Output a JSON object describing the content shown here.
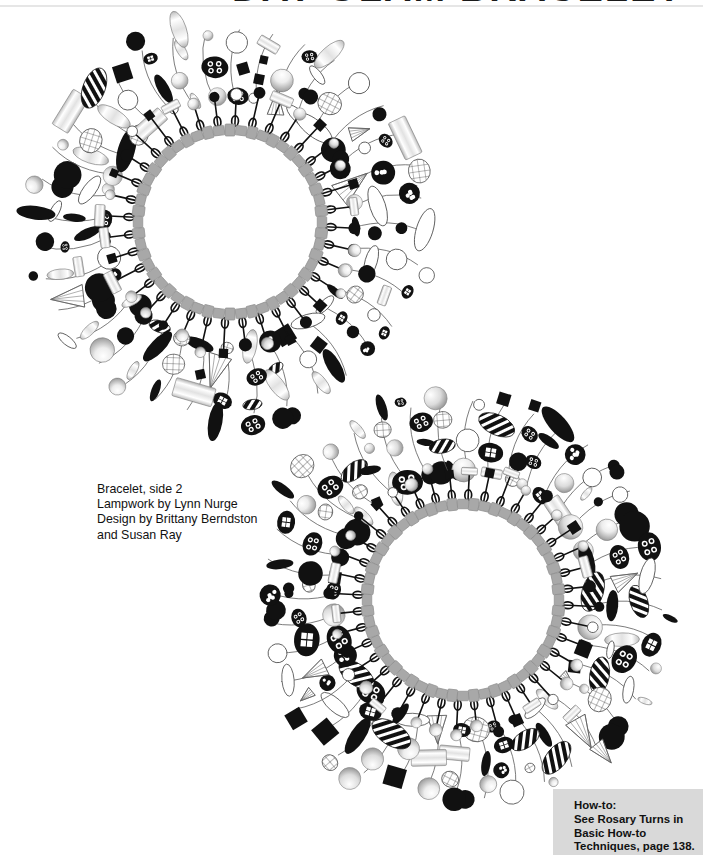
{
  "page": {
    "background_color": "#ffffff",
    "title_partial": "DAY-GLAM BRACELET",
    "rule_color": "#e6e6e6"
  },
  "caption": {
    "name": "bracelet-caption",
    "lines": [
      "Bracelet, side 2",
      "Lampwork by Lynn Nurge",
      "Design by Brittany Berndston",
      "and Susan Ray"
    ],
    "line1": "Bracelet, side 2",
    "line2": "Lampwork by Lynn Nurge",
    "line3": "Design by Brittany Berndston",
    "line4": "and Susan Ray"
  },
  "howto": {
    "name": "how-to-box",
    "background_color": "#d9d9d9",
    "heading": "How-to:",
    "line1": "See Rosary Turns in",
    "line2": "Basic How-to",
    "line3": "Techniques, page 138.",
    "reference_page": "138"
  },
  "illustrations": [
    {
      "id": "bracelet-1",
      "label": "Bracelet side 2 - upper illustration",
      "shape": "ring",
      "chain_color": "#a8a8a8",
      "bead_colors": [
        "#111111",
        "#ffffff",
        "#c9c9c9",
        "#8f8f8f"
      ],
      "charm_count": 36,
      "inner_radius_px": 92,
      "outer_radius_px": 205
    },
    {
      "id": "bracelet-2",
      "label": "Bracelet side 2 - lower illustration",
      "shape": "ring",
      "chain_color": "#a8a8a8",
      "bead_colors": [
        "#111111",
        "#ffffff",
        "#c9c9c9",
        "#8f8f8f"
      ],
      "charm_count": 40,
      "inner_radius_px": 96,
      "outer_radius_px": 212
    }
  ],
  "colors": {
    "ink": "#111111",
    "chain_gray": "#a8a8a8",
    "box_gray": "#d9d9d9",
    "rule_gray": "#e6e6e6",
    "white": "#ffffff"
  }
}
